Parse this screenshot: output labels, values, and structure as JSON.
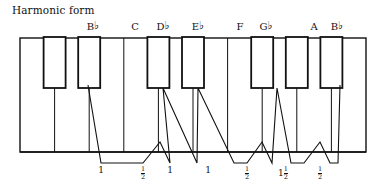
{
  "figure": {
    "title": "Harmonic form",
    "type": "piano-keyboard-interval-diagram",
    "colors": {
      "ink": "#1a1a1a",
      "white_key": "#ffffff",
      "black_key_fill": "#ffffff",
      "outline": "#111111"
    }
  },
  "keyboard": {
    "left": 20,
    "right": 366,
    "top": 38,
    "bottom": 152,
    "white_key_count": 10,
    "white_key_width": 34.6,
    "black_key_count": 7,
    "black_key_top": 38,
    "black_key_bottom": 88,
    "black_key_width": 22,
    "black_key_offsets": [
      1,
      2,
      4,
      5,
      6,
      8,
      9
    ],
    "white_key_boundaries": [
      20,
      54.6,
      89.2,
      123.8,
      158.4,
      193,
      227.6,
      262.2,
      296.8,
      331.4,
      366
    ]
  },
  "note_labels": [
    {
      "name": "B-flat-1",
      "letter": "B",
      "accidental": "♭",
      "x": 93
    },
    {
      "name": "C",
      "letter": "C",
      "accidental": "",
      "x": 135
    },
    {
      "name": "D-flat",
      "letter": "D",
      "accidental": "♭",
      "x": 163
    },
    {
      "name": "E-flat",
      "letter": "E",
      "accidental": "♭",
      "x": 198
    },
    {
      "name": "F",
      "letter": "F",
      "accidental": "",
      "x": 240
    },
    {
      "name": "G-flat",
      "letter": "G",
      "accidental": "♭",
      "x": 266
    },
    {
      "name": "A",
      "letter": "A",
      "accidental": "",
      "x": 314
    },
    {
      "name": "B-flat-2",
      "letter": "B",
      "accidental": "♭",
      "x": 337
    }
  ],
  "interval_labels": [
    {
      "name": "step-1",
      "whole": "1",
      "numerator": "",
      "denominator": "",
      "x": 101
    },
    {
      "name": "step-2",
      "whole": "",
      "numerator": "1",
      "denominator": "2",
      "x": 143
    },
    {
      "name": "step-3",
      "whole": "1",
      "numerator": "",
      "denominator": "",
      "x": 170
    },
    {
      "name": "step-4",
      "whole": "1",
      "numerator": "",
      "denominator": "",
      "x": 208
    },
    {
      "name": "step-5",
      "whole": "",
      "numerator": "1",
      "denominator": "2",
      "x": 247
    },
    {
      "name": "step-6",
      "whole": "1",
      "numerator": "1",
      "denominator": "2",
      "x": 283
    },
    {
      "name": "step-7",
      "whole": "",
      "numerator": "1",
      "denominator": "2",
      "x": 320
    }
  ],
  "trace": {
    "name": "interval-zigzag",
    "points": "88,85 101,163 143,163 160,142 170,163 163,88 197,163 198,88 234,163 247,163 262,142 272,163 277,88 291,163 304,163 320,142 330,163 338,163 340,85"
  }
}
